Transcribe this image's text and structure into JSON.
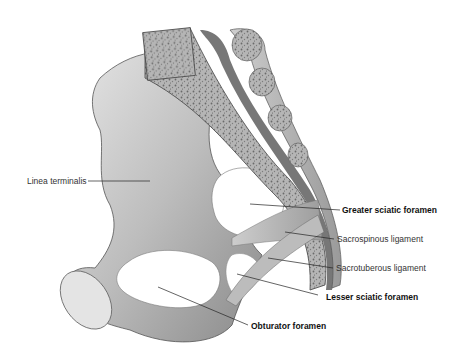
{
  "figure": {
    "colors": {
      "bone_light": "#d9d9d9",
      "bone_mid": "#a8a8a8",
      "bone_dark": "#6e6e6e",
      "cancellous": "#8c8c8c",
      "leader_line": "#222222",
      "background": "#ffffff"
    }
  },
  "labels": [
    {
      "id": "linea-terminalis",
      "text": "Linea terminalis",
      "bold": false
    },
    {
      "id": "greater-sciatic-foramen",
      "text": "Greater sciatic foramen",
      "bold": true
    },
    {
      "id": "sacrospinous-ligament",
      "text": "Sacrospinous ligament",
      "bold": false
    },
    {
      "id": "sacrotuberous-ligament",
      "text": "Sacrotuberous ligament",
      "bold": false
    },
    {
      "id": "lesser-sciatic-foramen",
      "text": "Lesser sciatic foramen",
      "bold": true
    },
    {
      "id": "obturator-foramen",
      "text": "Obturator foramen",
      "bold": true
    }
  ]
}
